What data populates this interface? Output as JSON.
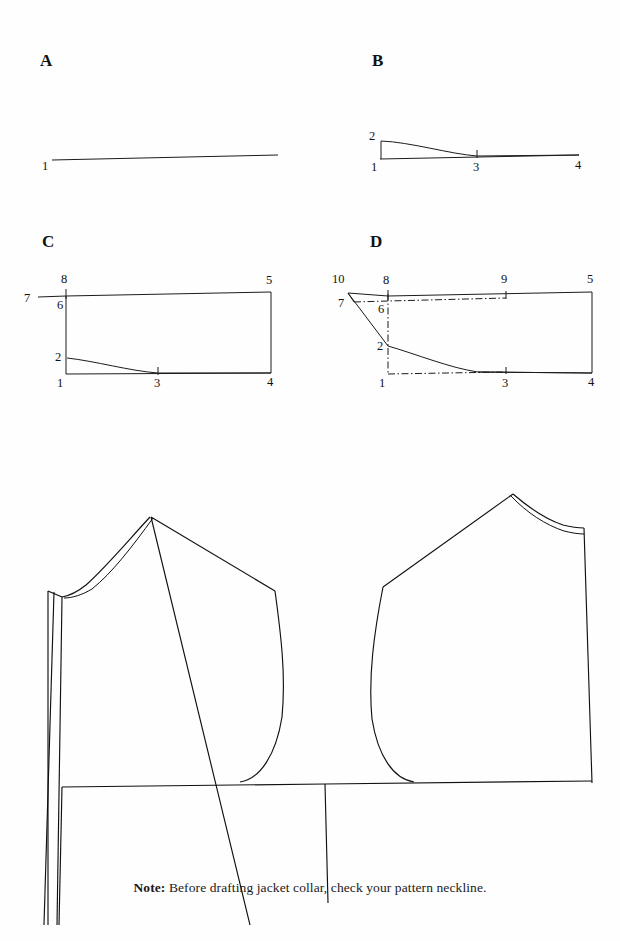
{
  "page": {
    "kind": "sewing-pattern-drafting-plate",
    "background_color": "#fefefe",
    "ink_color": "#1b1b1b"
  },
  "panels": [
    {
      "id": "a",
      "letter": "A",
      "description": "single slightly sloping horizontal base line",
      "point_labels": [
        "1"
      ]
    },
    {
      "id": "b",
      "letter": "B",
      "description": "base line 1 to 4 with curve from 2 blending into line near 3",
      "point_labels": [
        "2",
        "1",
        "3",
        "4"
      ]
    },
    {
      "id": "c",
      "letter": "C",
      "description": "rectangle 1-4-5-6 with neck curve 2 to 3 and extension line to 7, point 8 above 6",
      "point_labels": [
        "8",
        "7",
        "6",
        "5",
        "2",
        "1",
        "3",
        "4"
      ]
    },
    {
      "id": "d",
      "letter": "D",
      "description": "rectangle with collar stand line 10-7 to 2, dash-dot construction lines 6 to 9 and 1 to 3, point 9 midpoint of top line",
      "point_labels": [
        "10",
        "8",
        "9",
        "5",
        "7",
        "6",
        "2",
        "1",
        "3",
        "4"
      ]
    }
  ],
  "pattern": {
    "title": "jacket front and back bodice with neckline check",
    "pieces": [
      {
        "name": "front-bodice-piece",
        "features": [
          "double neckline curve",
          "shoulder seam",
          "armhole curve",
          "center front fold lines",
          "chest line"
        ]
      },
      {
        "name": "back-bodice-piece",
        "features": [
          "double neckline curve",
          "shoulder seam",
          "armhole curve",
          "center back line",
          "chest line"
        ]
      }
    ]
  },
  "note": {
    "label": "Note:",
    "text": " Before drafting jacket collar, check your pattern neckline."
  }
}
